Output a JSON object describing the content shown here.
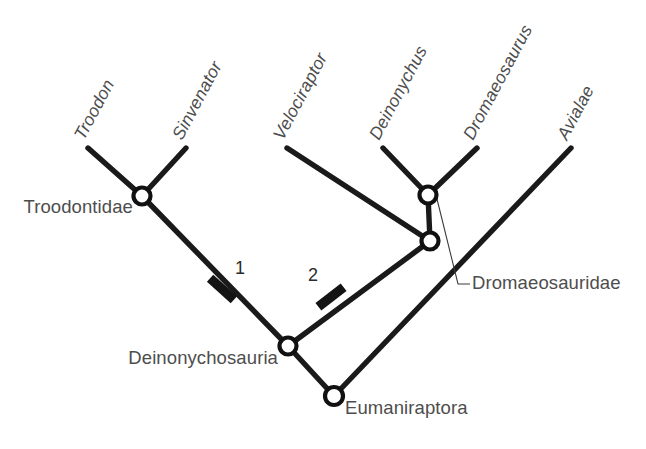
{
  "figure": {
    "type": "cladogram",
    "background_color": "#ffffff",
    "line_color": "#1a1a1a",
    "label_color": "#4d4d4d",
    "node_fill": "#ffffff"
  },
  "taxa": [
    {
      "id": "troodon",
      "label": "Troodon",
      "tip_x": 88,
      "tip_y": 148,
      "label_x": 84,
      "label_y": 141,
      "rotation": -62
    },
    {
      "id": "sinvenator",
      "label": "Sinvenator",
      "tip_x": 186,
      "tip_y": 148,
      "label_x": 182,
      "label_y": 141,
      "rotation": -62
    },
    {
      "id": "velociraptor",
      "label": "Velociraptor",
      "tip_x": 287,
      "tip_y": 148,
      "label_x": 283,
      "label_y": 141,
      "rotation": -62
    },
    {
      "id": "deinonychus",
      "label": "Deinonychus",
      "tip_x": 383,
      "tip_y": 148,
      "label_x": 379,
      "label_y": 141,
      "rotation": -62
    },
    {
      "id": "dromaeosaurus",
      "label": "Dromaeosaurus",
      "tip_x": 477,
      "tip_y": 148,
      "label_x": 473,
      "label_y": 141,
      "rotation": -62
    },
    {
      "id": "avialae",
      "label": "Avialae",
      "tip_x": 571,
      "tip_y": 148,
      "label_x": 567,
      "label_y": 141,
      "rotation": -62
    }
  ],
  "nodes": [
    {
      "id": "troodontidae",
      "label": "Troodontidae",
      "x": 142,
      "y": 196,
      "r": 8.5,
      "label_x": 133,
      "label_y": 213,
      "label_anchor": "end",
      "has_leader": false
    },
    {
      "id": "dromaeosauridae",
      "label": "Dromaeosauridae",
      "x": 428,
      "y": 195,
      "r": 8.5,
      "label_x": 472,
      "label_y": 289,
      "label_anchor": "start",
      "has_leader": true
    },
    {
      "id": "deinonychus-node",
      "label": "",
      "x": 430,
      "y": 241,
      "r": 8.5,
      "label_x": 0,
      "label_y": 0,
      "label_anchor": "start",
      "has_leader": false
    },
    {
      "id": "deinonychosauria",
      "label": "Deinonychosauria",
      "x": 288,
      "y": 346,
      "r": 8.5,
      "label_x": 278,
      "label_y": 364,
      "label_anchor": "end",
      "has_leader": false
    },
    {
      "id": "eumaniraptora",
      "label": "Eumaniraptora",
      "x": 334,
      "y": 396,
      "r": 9.0,
      "label_x": 345,
      "label_y": 414,
      "label_anchor": "start",
      "has_leader": false
    }
  ],
  "branches": [
    {
      "id": "branch-troodon",
      "x1": 88,
      "y1": 148,
      "x2": 142,
      "y2": 196
    },
    {
      "id": "branch-sinvenator",
      "x1": 186,
      "y1": 148,
      "x2": 142,
      "y2": 196
    },
    {
      "id": "branch-troodontidae-stem",
      "x1": 142,
      "y1": 196,
      "x2": 288,
      "y2": 346
    },
    {
      "id": "branch-velociraptor",
      "x1": 287,
      "y1": 148,
      "x2": 430,
      "y2": 241
    },
    {
      "id": "branch-deinonychus",
      "x1": 383,
      "y1": 148,
      "x2": 428,
      "y2": 195
    },
    {
      "id": "branch-dromaeosaurus",
      "x1": 477,
      "y1": 148,
      "x2": 428,
      "y2": 195
    },
    {
      "id": "branch-dromaeo-stem",
      "x1": 428,
      "y1": 195,
      "x2": 430,
      "y2": 241
    },
    {
      "id": "branch-deinonychosaur",
      "x1": 430,
      "y1": 241,
      "x2": 288,
      "y2": 346
    },
    {
      "id": "branch-left-root",
      "x1": 288,
      "y1": 346,
      "x2": 334,
      "y2": 396
    },
    {
      "id": "branch-avialae",
      "x1": 571,
      "y1": 148,
      "x2": 334,
      "y2": 396
    }
  ],
  "character_marks": [
    {
      "id": "character-1",
      "label": "1",
      "x": 222,
      "y": 289,
      "angle": 42,
      "length": 32,
      "label_x": 240,
      "label_y": 274
    },
    {
      "id": "character-2",
      "label": "2",
      "x": 331,
      "y": 297,
      "angle": -38,
      "length": 32,
      "label_x": 313,
      "label_y": 281
    }
  ],
  "leader": {
    "from_x": 437,
    "from_y": 199,
    "mid_x": 458,
    "mid_y": 284,
    "to_x": 470,
    "to_y": 284
  }
}
